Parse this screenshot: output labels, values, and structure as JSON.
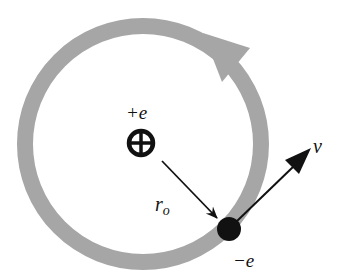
{
  "diagram": {
    "labels": {
      "proton_charge": "+e",
      "electron_charge": "−e",
      "radius": "r",
      "radius_subscript": "o",
      "velocity": "v"
    },
    "colors": {
      "orbit": "#a6a6a6",
      "ink": "#111111",
      "background": "#ffffff"
    },
    "elements": {
      "orbit": {
        "shape": "circle",
        "cx": 143,
        "cy": 144,
        "r": 118,
        "stroke_width": 16,
        "direction": "counterclockwise"
      },
      "proton": {
        "symbol": "circled-plus",
        "cx": 141,
        "cy": 143,
        "r": 14
      },
      "electron": {
        "symbol": "filled-dot",
        "cx": 229,
        "cy": 229,
        "r": 12
      },
      "radius_arrow": {
        "from": "proton",
        "to": "electron"
      },
      "velocity_arrow": {
        "from": "electron",
        "direction": "tangent up-right"
      }
    }
  }
}
